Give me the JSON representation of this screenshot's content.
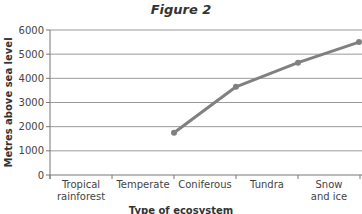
{
  "chart_data": {
    "type": "line",
    "title": "Figure 2",
    "xlabel": "Type of ecosystem",
    "ylabel": "Metres above sea level",
    "ylim": [
      0,
      6000
    ],
    "yticks": [
      0,
      1000,
      2000,
      3000,
      4000,
      5000,
      6000
    ],
    "categories": [
      "Tropical rainforest",
      "Temperate",
      "Coniferous",
      "Tundra",
      "Snow and ice"
    ],
    "category_lines": [
      [
        "Tropical",
        "rainforest"
      ],
      [
        "Temperate"
      ],
      [
        "Coniferous"
      ],
      [
        "Tundra"
      ],
      [
        "Snow",
        "and ice"
      ]
    ],
    "grid": true,
    "series": [
      {
        "name": "Altitude",
        "color": "#808080",
        "points": [
          {
            "x_boundary": 2,
            "value": 1750
          },
          {
            "x_boundary": 3,
            "value": 3650
          },
          {
            "x_boundary": 4,
            "value": 4650
          },
          {
            "x_boundary": 5,
            "value": 5500
          }
        ]
      }
    ]
  }
}
